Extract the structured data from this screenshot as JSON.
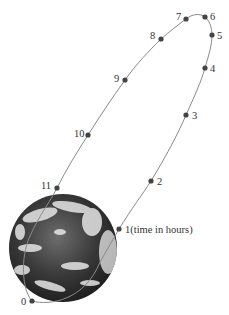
{
  "diagram": {
    "orbit_color": "#8a8a8a",
    "point_color": "#444444",
    "earth": {
      "cx": 63,
      "cy": 248,
      "r": 54
    },
    "points": [
      {
        "label": "0",
        "x": 32,
        "y": 301,
        "lx": 21,
        "ly": 305
      },
      {
        "label": "1(time in hours)",
        "x": 119,
        "y": 229,
        "lx": 125,
        "ly": 233
      },
      {
        "label": "2",
        "x": 151,
        "y": 181,
        "lx": 157,
        "ly": 185
      },
      {
        "label": "3",
        "x": 186,
        "y": 115,
        "lx": 192,
        "ly": 119
      },
      {
        "label": "4",
        "x": 205,
        "y": 68,
        "lx": 210,
        "ly": 72
      },
      {
        "label": "5",
        "x": 212,
        "y": 35,
        "lx": 217,
        "ly": 39
      },
      {
        "label": "6",
        "x": 205,
        "y": 17,
        "lx": 210,
        "ly": 20
      },
      {
        "label": "7",
        "x": 186,
        "y": 19,
        "lx": 176,
        "ly": 20
      },
      {
        "label": "8",
        "x": 161,
        "y": 39,
        "lx": 150,
        "ly": 39
      },
      {
        "label": "9",
        "x": 125,
        "y": 80,
        "lx": 114,
        "ly": 82
      },
      {
        "label": "10",
        "x": 88,
        "y": 135,
        "lx": 74,
        "ly": 137
      },
      {
        "label": "11",
        "x": 57,
        "y": 188,
        "lx": 41,
        "ly": 189
      }
    ]
  }
}
